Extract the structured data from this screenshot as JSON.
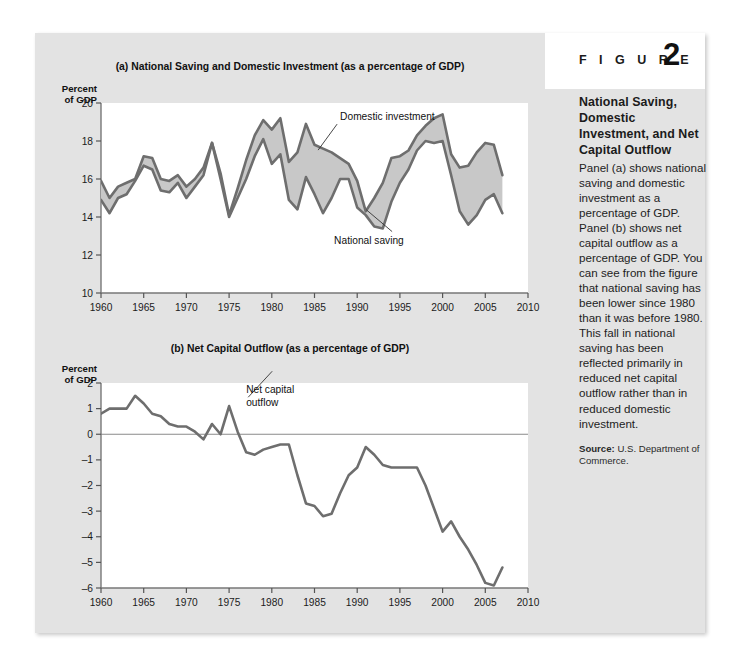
{
  "figure": {
    "word": "F I G U R E",
    "number": "2",
    "caption_title": "National Saving, Domestic Investment, and Net Capital Outflow",
    "caption_body": "Panel (a) shows national saving and domestic investment as a percentage of GDP. Panel (b) shows net capital outflow as a percentage of GDP. You can see from the figure that national saving has been lower since 1980 than it was before 1980. This fall in national saving has been reflected primarily in reduced net capital outflow rather than in reduced domestic investment.",
    "source_label": "Source:",
    "source_text": " U.S. Department of Commerce."
  },
  "colors": {
    "page_background": "#e3e3e3",
    "plot_background": "#ffffff",
    "line": "#6e6e6e",
    "fill": "#c8c8c8",
    "text": "#1b1b1b",
    "zero_line": "#8a8a8a"
  },
  "chart_data": [
    {
      "type": "line",
      "panel": "a",
      "title": "(a) National Saving and Domestic Investment (as a percentage of GDP)",
      "ylabel": "Percent of GDP",
      "xlabel": "",
      "xlim": [
        1960,
        2010
      ],
      "ylim": [
        10,
        20
      ],
      "yticks": [
        10,
        12,
        14,
        16,
        18,
        20
      ],
      "xticks": [
        1960,
        1965,
        1970,
        1975,
        1980,
        1985,
        1990,
        1995,
        2000,
        2005,
        2010
      ],
      "grid": false,
      "legend": "inline-annotations",
      "annotations": [
        {
          "text": "Domestic investment",
          "year": 1988,
          "value": 19.1
        },
        {
          "text": "National saving",
          "year": 1988,
          "value": 12.6
        }
      ],
      "x": [
        1960,
        1961,
        1962,
        1963,
        1964,
        1965,
        1966,
        1967,
        1968,
        1969,
        1970,
        1971,
        1972,
        1973,
        1974,
        1975,
        1976,
        1977,
        1978,
        1979,
        1980,
        1981,
        1982,
        1983,
        1984,
        1985,
        1986,
        1987,
        1988,
        1989,
        1990,
        1991,
        1992,
        1993,
        1994,
        1995,
        1996,
        1997,
        1998,
        1999,
        2000,
        2001,
        2002,
        2003,
        2004,
        2005,
        2006,
        2007
      ],
      "series": [
        {
          "name": "Domestic investment",
          "values": [
            15.9,
            15.0,
            15.6,
            15.8,
            16.0,
            17.2,
            17.1,
            16.0,
            15.9,
            16.2,
            15.6,
            16.0,
            16.6,
            17.9,
            16.3,
            14.1,
            15.5,
            17.0,
            18.3,
            19.1,
            18.6,
            19.2,
            16.9,
            17.4,
            18.9,
            17.8,
            17.6,
            17.4,
            17.1,
            16.8,
            15.9,
            14.3,
            15.0,
            15.8,
            17.1,
            17.2,
            17.5,
            18.3,
            18.8,
            19.2,
            19.4,
            17.3,
            16.6,
            16.7,
            17.4,
            17.9,
            17.8,
            16.2
          ]
        },
        {
          "name": "National saving",
          "values": [
            14.9,
            14.2,
            15.0,
            15.2,
            15.9,
            16.7,
            16.5,
            15.4,
            15.3,
            15.8,
            15.0,
            15.6,
            16.2,
            17.9,
            16.0,
            14.0,
            15.0,
            16.0,
            17.2,
            18.1,
            16.8,
            17.3,
            14.9,
            14.4,
            16.1,
            15.2,
            14.2,
            15.0,
            16.0,
            16.0,
            14.5,
            14.1,
            13.5,
            13.4,
            14.8,
            15.8,
            16.5,
            17.5,
            18.0,
            17.9,
            18.0,
            16.2,
            14.3,
            13.6,
            14.1,
            14.9,
            15.2,
            14.2
          ]
        }
      ]
    },
    {
      "type": "line",
      "panel": "b",
      "title": "(b) Net Capital Outflow (as a percentage of GDP)",
      "ylabel": "Percent of GDP",
      "xlabel": "",
      "xlim": [
        1960,
        2010
      ],
      "ylim": [
        -6,
        2
      ],
      "yticks": [
        2,
        1,
        0,
        -1,
        -2,
        -3,
        -4,
        -5,
        -6
      ],
      "xticks": [
        1960,
        1965,
        1970,
        1975,
        1980,
        1985,
        1990,
        1995,
        2000,
        2005,
        2010
      ],
      "grid": false,
      "zero_line": true,
      "annotations": [
        {
          "text": "Net capital outflow",
          "year": 1977,
          "value": 1.6
        }
      ],
      "x": [
        1960,
        1961,
        1962,
        1963,
        1964,
        1965,
        1966,
        1967,
        1968,
        1969,
        1970,
        1971,
        1972,
        1973,
        1974,
        1975,
        1976,
        1977,
        1978,
        1979,
        1980,
        1981,
        1982,
        1983,
        1984,
        1985,
        1986,
        1987,
        1988,
        1989,
        1990,
        1991,
        1992,
        1993,
        1994,
        1995,
        1996,
        1997,
        1998,
        1999,
        2000,
        2001,
        2002,
        2003,
        2004,
        2005,
        2006,
        2007
      ],
      "series": [
        {
          "name": "Net capital outflow",
          "values": [
            0.8,
            1.0,
            1.0,
            1.0,
            1.5,
            1.2,
            0.8,
            0.7,
            0.4,
            0.3,
            0.3,
            0.1,
            -0.2,
            0.4,
            0.0,
            1.1,
            0.1,
            -0.7,
            -0.8,
            -0.6,
            -0.5,
            -0.4,
            -0.4,
            -1.6,
            -2.7,
            -2.8,
            -3.2,
            -3.1,
            -2.3,
            -1.6,
            -1.3,
            -0.5,
            -0.8,
            -1.2,
            -1.3,
            -1.3,
            -1.3,
            -1.3,
            -2.0,
            -2.9,
            -3.8,
            -3.4,
            -4.0,
            -4.5,
            -5.1,
            -5.8,
            -5.9,
            -5.2
          ]
        }
      ]
    }
  ]
}
